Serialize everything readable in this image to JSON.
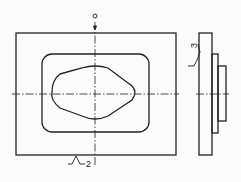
{
  "drawing": {
    "type": "technical-drawing",
    "views": [
      "front-view",
      "side-view"
    ],
    "annotations": {
      "surface_roughness_side": "3",
      "surface_roughness_bottom": "2"
    },
    "colors": {
      "line": "#222222",
      "background": "#fbfbfb"
    }
  }
}
